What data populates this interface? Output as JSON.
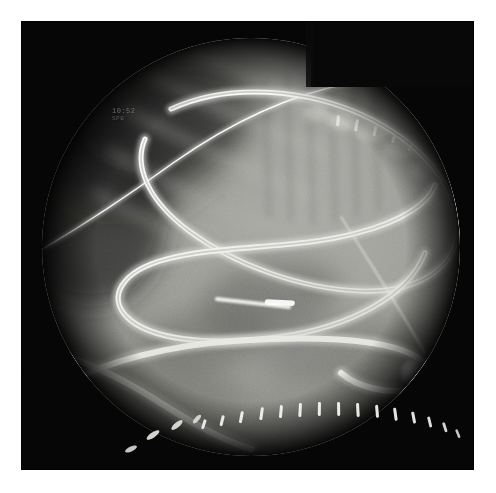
{
  "image": {
    "modality_label": "fluoroscopy-radiograph",
    "description": "Abdominal fluoroscopic image showing a looped endoscope, guidewire and a row of surgical staples",
    "canvas": {
      "width": 496,
      "height": 493
    },
    "page_background": "#ffffff",
    "margin_px": 21
  },
  "frame": {
    "left": 21,
    "top": 21,
    "width": 453,
    "height": 449,
    "background_color": "#050505"
  },
  "collimator": {
    "shape": "circle",
    "center_x": 230,
    "center_y": 226,
    "radius": 209,
    "notch": {
      "shape": "rectangle",
      "x": 290,
      "y": 0,
      "width": 180,
      "height": 66,
      "color": "#060606"
    },
    "field_base_color": "#8e8e8b",
    "vignette_color": "#0a0a0a"
  },
  "overlay": {
    "line1": "10:52",
    "line2": "SPB"
  },
  "anatomy": {
    "soft_tissue_tone": "#9a9a96",
    "dense_tissue_tone": "#6d6d69",
    "lucent_tone": "#5b5b57",
    "bone_tone": "#b5b5b0",
    "diaphragm_label": "diaphragm-shadow",
    "rib_label": "rib-shadow",
    "spine_label": "vertebral-shadow",
    "bowel_gas_label": "bowel-gas-shadow"
  },
  "instruments": {
    "endoscope": {
      "name": "endoscope-tube",
      "stroke_color": "#f2f2ee",
      "inner_color": "#c9c9c4",
      "width_px": 9,
      "notes": "Large alpha loop in mid-abdomen with tip curving to lower right"
    },
    "guidewire": {
      "name": "guidewire",
      "stroke_color": "#ededea",
      "width_px": 2.4,
      "notes": "Thin radiopaque wire crossing upper field diagonally"
    },
    "catheter": {
      "name": "catheter-marker",
      "stroke_color": "#f6f6f2",
      "width_px": 4,
      "notes": "Short bright segment near centre of loop"
    }
  },
  "staples": {
    "name": "surgical-staple-row",
    "color": "#f4f4ee",
    "count": 16,
    "positions": [
      {
        "x": 183,
        "y": 424,
        "angle": 72,
        "len": 9
      },
      {
        "x": 200,
        "y": 420,
        "angle": 62,
        "len": 10
      },
      {
        "x": 219,
        "y": 414,
        "angle": 52,
        "len": 11
      },
      {
        "x": 239,
        "y": 409,
        "angle": 40,
        "len": 12
      },
      {
        "x": 258,
        "y": 405,
        "angle": 30,
        "len": 12
      },
      {
        "x": 277,
        "y": 402,
        "angle": 22,
        "len": 13
      },
      {
        "x": 296,
        "y": 400,
        "angle": 16,
        "len": 13
      },
      {
        "x": 315,
        "y": 399,
        "angle": 10,
        "len": 13
      },
      {
        "x": 334,
        "y": 399,
        "angle": 6,
        "len": 13
      },
      {
        "x": 353,
        "y": 400,
        "angle": 2,
        "len": 13
      },
      {
        "x": 372,
        "y": 402,
        "angle": -2,
        "len": 12
      },
      {
        "x": 390,
        "y": 406,
        "angle": -6,
        "len": 12
      },
      {
        "x": 407,
        "y": 411,
        "angle": -10,
        "len": 11
      },
      {
        "x": 423,
        "y": 417,
        "angle": -14,
        "len": 10
      },
      {
        "x": 437,
        "y": 424,
        "angle": -18,
        "len": 9
      },
      {
        "x": 449,
        "y": 432,
        "angle": -22,
        "len": 8
      }
    ],
    "outlier_clips": [
      {
        "x": 128,
        "y": 438,
        "angle": 62,
        "len": 9
      },
      {
        "x": 152,
        "y": 430,
        "angle": 55,
        "len": 9
      },
      {
        "x": 107,
        "y": 447,
        "angle": 74,
        "len": 8
      }
    ]
  },
  "upper_clips": {
    "name": "upper-surgical-clips",
    "color": "#e6e6e0",
    "positions": [
      {
        "x": 318,
        "y": 100,
        "angle": 84,
        "len": 10
      },
      {
        "x": 336,
        "y": 103,
        "angle": 80,
        "len": 11
      },
      {
        "x": 355,
        "y": 108,
        "angle": 76,
        "len": 10
      },
      {
        "x": 373,
        "y": 115,
        "angle": 72,
        "len": 9
      },
      {
        "x": 390,
        "y": 124,
        "angle": 66,
        "len": 8
      }
    ]
  },
  "viewer_controls": {
    "zoom_label": "",
    "has_toolbar": false
  }
}
